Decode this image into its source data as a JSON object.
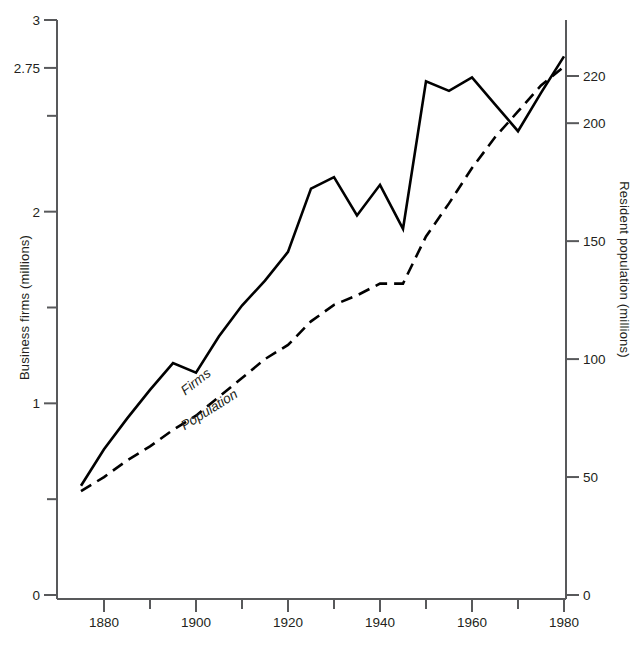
{
  "chart_data": {
    "type": "line",
    "title": "",
    "xlabel": "",
    "ylabel": "Business firms (millions)",
    "y2label": "Resident population (millions)",
    "xlim": [
      1874,
      1981
    ],
    "ylim": [
      0,
      3
    ],
    "y2lim": [
      0,
      225
    ],
    "grid": false,
    "legend": "inline-curve-labels",
    "x_ticks_major": [
      1880,
      1900,
      1920,
      1940,
      1960,
      1980
    ],
    "x_tick_labels": [
      "1880",
      "1900",
      "1920",
      "1940",
      "1960",
      "1980"
    ],
    "x_ticks_minor": [
      1890,
      1910,
      1930,
      1950,
      1970
    ],
    "y_ticks_major": [
      0,
      1,
      2,
      2.75,
      3
    ],
    "y_tick_labels": [
      "0",
      "1",
      "2",
      "2.75",
      "3"
    ],
    "y_ticks_minor": [
      0.5,
      1.5,
      2.5
    ],
    "y2_ticks_major": [
      0,
      50,
      100,
      150,
      200,
      220
    ],
    "y2_tick_labels": [
      "0",
      "50",
      "100",
      "150",
      "200",
      "220"
    ],
    "series": [
      {
        "name": "Firms",
        "axis": "left",
        "style": "solid",
        "color": "#000000",
        "label_text": "Firms",
        "x": [
          1875,
          1880,
          1885,
          1890,
          1895,
          1900,
          1905,
          1910,
          1915,
          1920,
          1925,
          1930,
          1935,
          1940,
          1945,
          1950,
          1955,
          1960,
          1965,
          1970,
          1975,
          1980
        ],
        "values": [
          0.57,
          0.76,
          0.92,
          1.07,
          1.21,
          1.16,
          1.35,
          1.51,
          1.64,
          1.79,
          2.12,
          2.18,
          1.98,
          2.14,
          1.91,
          2.68,
          2.63,
          2.7,
          2.56,
          2.42,
          2.62,
          2.81
        ]
      },
      {
        "name": "Population",
        "axis": "right",
        "style": "dashed",
        "color": "#000000",
        "label_text": "Population",
        "x": [
          1875,
          1880,
          1885,
          1890,
          1895,
          1900,
          1905,
          1910,
          1915,
          1920,
          1925,
          1930,
          1935,
          1940,
          1945,
          1950,
          1955,
          1960,
          1965,
          1970,
          1975,
          1980
        ],
        "values": [
          44,
          50,
          57,
          63,
          70,
          76,
          84,
          92,
          100,
          106,
          116,
          123,
          127,
          132,
          132,
          152,
          166,
          181,
          194,
          205,
          216,
          224
        ]
      }
    ]
  },
  "labels": {
    "firms_curve_label": "Firms",
    "population_curve_label": "Population",
    "left_axis_title": "Business firms (millions)",
    "right_axis_title": "Resident population (millions)"
  }
}
